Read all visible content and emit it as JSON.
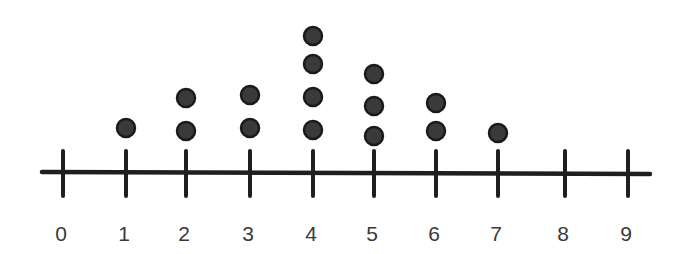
{
  "chart_data": {
    "type": "dot_plot",
    "title": "",
    "xlabel": "",
    "ylabel": "",
    "categories": [
      "0",
      "1",
      "2",
      "3",
      "4",
      "5",
      "6",
      "7",
      "8",
      "9"
    ],
    "values": [
      0,
      1,
      2,
      2,
      4,
      3,
      2,
      1,
      0,
      0
    ],
    "xlim": [
      0,
      9
    ],
    "grid": false,
    "legend": null,
    "colors": {
      "dot_fill": "#3a3a3a",
      "dot_stroke": "#1a1a1a",
      "axis": "#1f1f1f",
      "label": "#3a3a3a"
    }
  },
  "layout": {
    "tick_x": [
      63,
      126,
      186,
      250,
      313,
      374,
      436,
      498,
      565,
      628
    ],
    "dot_y": [
      [],
      [
        128
      ],
      [
        131,
        98
      ],
      [
        128,
        95
      ],
      [
        130,
        97,
        64,
        36
      ],
      [
        136,
        106,
        74
      ],
      [
        131,
        103
      ],
      [
        133
      ],
      [],
      []
    ]
  }
}
